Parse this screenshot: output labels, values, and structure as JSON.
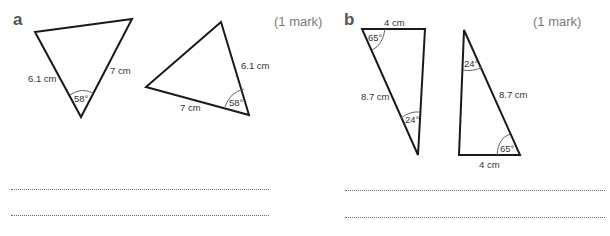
{
  "part_a": {
    "label": "a",
    "marks": "(1 mark)",
    "triangle1": {
      "left_side": "6.1 cm",
      "right_side": "7 cm",
      "angle": "58°"
    },
    "triangle2": {
      "right_side": "6.1 cm",
      "bottom_side": "7 cm",
      "angle": "58°"
    }
  },
  "part_b": {
    "label": "b",
    "marks": "(1 mark)",
    "triangle1": {
      "top_side": "4 cm",
      "hypotenuse": "8.7 cm",
      "top_angle": "65°",
      "bottom_angle": "24°"
    },
    "triangle2": {
      "bottom_side": "4 cm",
      "hypotenuse": "8.7 cm",
      "top_angle": "24°",
      "bottom_angle": "65°"
    }
  },
  "answer_lines": {
    "count_per_part": 2
  }
}
